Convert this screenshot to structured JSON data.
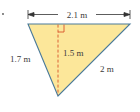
{
  "diagram": {
    "type": "triangle-with-height",
    "colors": {
      "fill": "#fce79a",
      "edge": "#4a7a9a",
      "height_line": "#d9542a",
      "right_angle": "#d9542a",
      "dimension_line": "#333333",
      "text": "#3a3a3a"
    },
    "labels": {
      "top_dimension": "2.1 m",
      "left_side": "1.7 m",
      "right_side": "2 m",
      "height": "1.5 m",
      "bullet": "."
    },
    "values": {
      "base_m": 2.1,
      "left_side_m": 1.7,
      "right_side_m": 2,
      "height_m": 1.5
    }
  }
}
